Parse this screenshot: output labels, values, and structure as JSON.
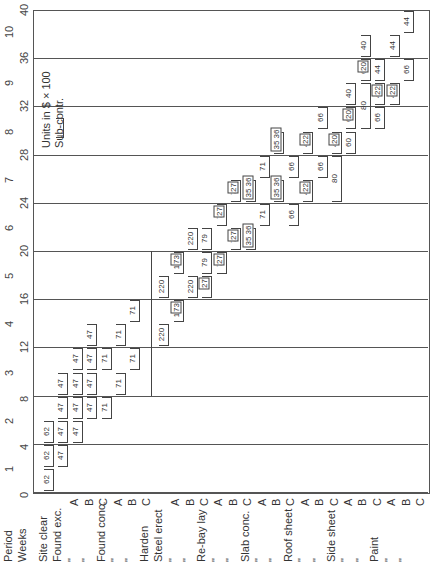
{
  "chart_data": {
    "type": "bar",
    "subtype": "linear-schedule (rotated gantt)",
    "title": "",
    "xlabel": "Activities",
    "ylabel": "Weeks",
    "axis_labels": {
      "period": "Period",
      "weeks": "Weeks"
    },
    "legend_text": [
      "Units in $ x 100",
      "Sub-contr."
    ],
    "weeks_ticks": [
      0,
      4,
      8,
      12,
      16,
      20,
      24,
      28,
      32,
      36,
      40
    ],
    "period_ticks": [
      1,
      2,
      3,
      4,
      5,
      6,
      7,
      8,
      9,
      10
    ],
    "ylim": [
      0,
      40
    ],
    "grid": true,
    "activities": [
      {
        "label": "Site clear",
        "sub": "",
        "segments": [
          {
            "start": 0,
            "end": 2,
            "value": "62"
          },
          {
            "start": 2,
            "end": 4,
            "value": "62"
          },
          {
            "start": 4,
            "end": 6,
            "value": "62"
          }
        ]
      },
      {
        "label": "Found exc.",
        "sub": "A",
        "segments": [
          {
            "start": 2,
            "end": 4,
            "value": "47"
          },
          {
            "start": 4,
            "end": 6,
            "value": "47"
          },
          {
            "start": 6,
            "end": 8,
            "value": "47"
          },
          {
            "start": 8,
            "end": 10,
            "value": "47"
          }
        ]
      },
      {
        "label": "\"",
        "sub": "B",
        "segments": [
          {
            "start": 4,
            "end": 6,
            "value": "47"
          },
          {
            "start": 6,
            "end": 8,
            "value": "47"
          },
          {
            "start": 8,
            "end": 10,
            "value": "47"
          },
          {
            "start": 10,
            "end": 12,
            "value": "47"
          }
        ]
      },
      {
        "label": "\"",
        "sub": "C",
        "segments": [
          {
            "start": 6,
            "end": 8,
            "value": "47"
          },
          {
            "start": 8,
            "end": 10,
            "value": "47"
          },
          {
            "start": 10,
            "end": 12,
            "value": "47"
          },
          {
            "start": 12,
            "end": 14,
            "value": "47"
          }
        ]
      },
      {
        "label": "Found conc.",
        "sub": "A",
        "segments": [
          {
            "start": 6,
            "end": 8,
            "value": "71"
          },
          {
            "start": 10,
            "end": 12,
            "value": "71"
          }
        ]
      },
      {
        "label": "\"",
        "sub": "B",
        "segments": [
          {
            "start": 8,
            "end": 10,
            "value": "71"
          },
          {
            "start": 12,
            "end": 14,
            "value": "71"
          }
        ]
      },
      {
        "label": "\"",
        "sub": "C",
        "segments": [
          {
            "start": 10,
            "end": 12,
            "value": "71"
          },
          {
            "start": 14,
            "end": 16,
            "value": "71"
          }
        ]
      },
      {
        "label": "Harden",
        "sub": "",
        "segments": [
          {
            "start": 8,
            "end": 20,
            "value": ""
          }
        ]
      },
      {
        "label": "Steel erect",
        "sub": "A",
        "segments": [
          {
            "start": 12,
            "end": 14,
            "value": "220"
          },
          {
            "start": 16,
            "end": 18,
            "value": "220"
          }
        ]
      },
      {
        "label": "\"",
        "sub": "B",
        "segments": [
          {
            "start": 14,
            "end": 16,
            "value": "147",
            "boxed": "73"
          },
          {
            "start": 18,
            "end": 20,
            "value": "147",
            "boxed": "73"
          }
        ]
      },
      {
        "label": "\"",
        "sub": "C",
        "segments": [
          {
            "start": 16,
            "end": 18,
            "value": "220"
          },
          {
            "start": 20,
            "end": 22,
            "value": "220"
          }
        ]
      },
      {
        "label": "Re-bay lay",
        "sub": "A",
        "segments": [
          {
            "start": 16,
            "end": 18,
            "value": "",
            "boxed": "27"
          },
          {
            "start": 18,
            "end": 20,
            "value": "79"
          },
          {
            "start": 20,
            "end": 22,
            "value": "79"
          }
        ]
      },
      {
        "label": "\"",
        "sub": "B",
        "segments": [
          {
            "start": 18,
            "end": 20,
            "value": "79",
            "boxed": "27"
          },
          {
            "start": 22,
            "end": 24,
            "value": "79",
            "boxed": "27"
          }
        ]
      },
      {
        "label": "\"",
        "sub": "C",
        "segments": [
          {
            "start": 20,
            "end": 22,
            "value": "79",
            "boxed": "27"
          },
          {
            "start": 24,
            "end": 26,
            "value": "79",
            "boxed": "27"
          }
        ]
      },
      {
        "label": "Slab conc.",
        "sub": "A",
        "segments": [
          {
            "start": 20,
            "end": 22,
            "value": "",
            "boxed": "35 36"
          },
          {
            "start": 24,
            "end": 26,
            "value": "",
            "boxed": "35 36"
          }
        ]
      },
      {
        "label": "\"",
        "sub": "B",
        "segments": [
          {
            "start": 22,
            "end": 24,
            "value": "71"
          },
          {
            "start": 26,
            "end": 28,
            "value": "71"
          }
        ]
      },
      {
        "label": "\"",
        "sub": "C",
        "segments": [
          {
            "start": 24,
            "end": 26,
            "value": "",
            "boxed": "35 36"
          },
          {
            "start": 28,
            "end": 30,
            "value": "",
            "boxed": "35 36"
          }
        ]
      },
      {
        "label": "Roof sheet",
        "sub": "A",
        "segments": [
          {
            "start": 22,
            "end": 24,
            "value": "66"
          },
          {
            "start": 26,
            "end": 28,
            "value": "66"
          }
        ]
      },
      {
        "label": "\"",
        "sub": "B",
        "segments": [
          {
            "start": 24,
            "end": 26,
            "value": "44",
            "boxed": "22"
          },
          {
            "start": 28,
            "end": 30,
            "value": "44",
            "boxed": "22"
          }
        ]
      },
      {
        "label": "\"",
        "sub": "C",
        "segments": [
          {
            "start": 26,
            "end": 28,
            "value": "66"
          },
          {
            "start": 30,
            "end": 32,
            "value": "66"
          }
        ]
      },
      {
        "label": "Side sheet",
        "sub": "A",
        "segments": [
          {
            "start": 24,
            "end": 28,
            "value": "80"
          },
          {
            "start": 28,
            "end": 30,
            "value": "40",
            "boxed": "20"
          }
        ]
      },
      {
        "label": "\"",
        "sub": "B",
        "segments": [
          {
            "start": 28,
            "end": 30,
            "value": "60"
          },
          {
            "start": 30,
            "end": 32,
            "value": "60",
            "boxed": "20"
          },
          {
            "start": 32,
            "end": 34,
            "value": "40"
          }
        ]
      },
      {
        "label": "\"",
        "sub": "C",
        "segments": [
          {
            "start": 30,
            "end": 34,
            "value": "80"
          },
          {
            "start": 34,
            "end": 36,
            "value": "60",
            "boxed": "20"
          },
          {
            "start": 36,
            "end": 38,
            "value": "40"
          }
        ]
      },
      {
        "label": "Paint",
        "sub": "A",
        "segments": [
          {
            "start": 30,
            "end": 32,
            "value": "66"
          },
          {
            "start": 32,
            "end": 34,
            "value": "44",
            "boxed": "22"
          },
          {
            "start": 34,
            "end": 36,
            "value": "44"
          }
        ]
      },
      {
        "label": "\"",
        "sub": "B",
        "segments": [
          {
            "start": 32,
            "end": 34,
            "value": "44",
            "boxed": "22"
          },
          {
            "start": 36,
            "end": 38,
            "value": "44"
          }
        ]
      },
      {
        "label": "\"",
        "sub": "C",
        "segments": [
          {
            "start": 34,
            "end": 36,
            "value": "66"
          },
          {
            "start": 38,
            "end": 40,
            "value": "44"
          }
        ]
      }
    ]
  },
  "labels": {
    "period": "Period",
    "weeks": "Weeks",
    "legend_line1": "Units in $ × 100",
    "legend_line2": "Sub-contr."
  }
}
